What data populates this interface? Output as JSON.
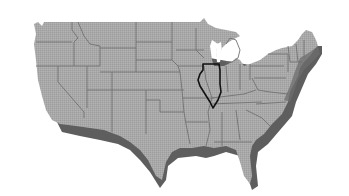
{
  "map": {
    "subject": "United States (contiguous 48 states)",
    "style": "grayscale shaded relief with drop shadow",
    "highlighted_state": "Illinois",
    "colors": {
      "background": "#ffffff",
      "land_fill": "#a8a8a8",
      "state_border": "#707070",
      "shadow": "#5c5c5c",
      "highlight_outline": "#111111",
      "water": "#ffffff"
    }
  }
}
